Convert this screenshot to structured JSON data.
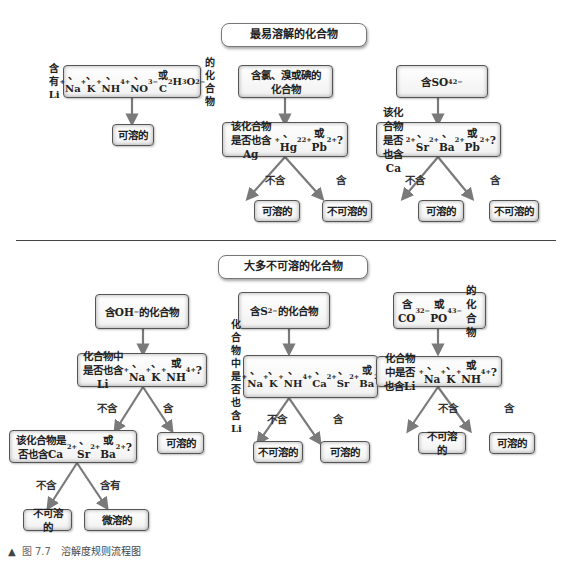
{
  "top_section": {
    "title": "最易溶解的化合物",
    "col1": {
      "condition_html": "含有Li<sup>+</sup>、Na<sup>+</sup>、K<sup>+</sup>、NH<sub>4</sub><sup>+</sup>、<br>NO<sub>3</sub><sup>−</sup>或C<sub>2</sub>H<sub>3</sub>O<sub>2</sub><sup>−</sup>的化合物",
      "result": "可溶的"
    },
    "col2": {
      "condition_html": "含氯、溴或碘的<br>化合物",
      "question_html": "该化合物是否也含Ag<sup>+</sup>、<br>Hg<sub>2</sub><sup>2+</sup>或Pb<sup>2+</sup>?",
      "no_label": "不含",
      "yes_label": "含",
      "no_result": "可溶的",
      "yes_result": "不可溶的"
    },
    "col3": {
      "condition_html": "含SO<sub>4</sub><sup>2−</sup>",
      "question_html": "该化合物是否也含Ca<sup>2+</sup>、<br>Sr<sup>2+</sup>、Ba<sup>2+</sup>或Pb<sup>2+</sup>?",
      "no_label": "不含",
      "yes_label": "含",
      "no_result": "可溶的",
      "yes_result": "不可溶的"
    }
  },
  "bottom_section": {
    "title": "大多不可溶的化合物",
    "col1": {
      "condition_html": "含OH<sup>−</sup>的化合物",
      "question_html": "化合物中是否也含Li<sup>+</sup>、<br>Na<sup>+</sup>、K<sup>+</sup>或NH<sub>4</sub><sup>+</sup>?",
      "no_label": "不含",
      "yes_label": "含",
      "yes_result": "可溶的",
      "question2_html": "该化合物是否也含Ca<sup>2+</sup>、<br>Sr<sup>2+</sup>或Ba<sup>2+</sup>?",
      "no2_label": "不含",
      "yes2_label": "含有",
      "no2_result": "不可溶的",
      "yes2_result": "微溶的"
    },
    "col2": {
      "condition_html": "含S<sup>2−</sup>的化合物",
      "question_html": "化合物中是否也含Li<sup>+</sup>、<br>Na<sup>+</sup>、K<sup>+</sup>、NH<sub>4</sub><sup>+</sup>、Ca<sup>2+</sup>、<br>Sr<sup>2+</sup>或Ba<sup>2+</sup>?",
      "no_label": "不含",
      "yes_label": "含",
      "no_result": "不可溶的",
      "yes_result": "可溶的"
    },
    "col3": {
      "condition_html": "含CO<sub>3</sub><sup>2−</sup>或PO<sub>4</sub><sup>3−</sup>的<br>化合物",
      "question_html": "化合物中是否也含Li<sup>+</sup>、<br>Na<sup>+</sup>、K<sup>+</sup>或NH<sub>4</sub><sup>+</sup>?",
      "no_label": "不含",
      "yes_label": "含",
      "no_result": "不可溶的",
      "yes_result": "可溶的"
    }
  },
  "caption": {
    "marker": "▲",
    "figure_number": "图 7.7",
    "text": "溶解度规则流程图"
  },
  "colors": {
    "arrow": "#7a7a7a",
    "box_border": "#555555",
    "divider": "#444444"
  }
}
